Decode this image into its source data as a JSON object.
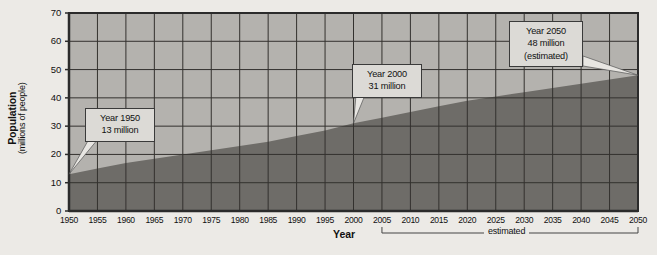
{
  "figure": {
    "background_color": "#eceae6",
    "plot_background_color": "#b4b2ae",
    "area_fill_color": "#6e6c68",
    "axis_color": "#2b2b2b",
    "grid_color": "#33312e",
    "callout_fill_color": "#dcdad6",
    "callout_border_color": "#3a3a3a"
  },
  "axes": {
    "y_title_main": "Population",
    "y_title_sub": "(millions of people)",
    "x_title": "Year",
    "y_ticks": [
      "0",
      "10",
      "20",
      "30",
      "40",
      "50",
      "60",
      "70"
    ],
    "x_ticks": [
      "1950",
      "1955",
      "1960",
      "1965",
      "1970",
      "1975",
      "1980",
      "1985",
      "1990",
      "1995",
      "2000",
      "2005",
      "2010",
      "2015",
      "2020",
      "2025",
      "2030",
      "2035",
      "2040",
      "2045",
      "2050"
    ]
  },
  "annotations": {
    "estimated_bracket_label": "estimated",
    "estimated_bracket_start_year": 2005,
    "estimated_bracket_end_year": 2050,
    "callouts": [
      {
        "name": "callout-1950",
        "lines": [
          "Year 1950",
          "13 million"
        ],
        "point_year": 1950,
        "point_value": 13
      },
      {
        "name": "callout-2000",
        "lines": [
          "Year 2000",
          "31 million"
        ],
        "point_year": 2000,
        "point_value": 31
      },
      {
        "name": "callout-2050",
        "lines": [
          "Year 2050",
          "48 million",
          "(estimated)"
        ],
        "point_year": 2050,
        "point_value": 48
      }
    ]
  },
  "chart_data": {
    "type": "area",
    "title": "",
    "subtitle": "",
    "xlabel": "Year",
    "ylabel": "Population (millions of people)",
    "xlim": [
      1950,
      2050
    ],
    "ylim": [
      0,
      70
    ],
    "grid": true,
    "legend": "none",
    "x": [
      1950,
      1955,
      1960,
      1965,
      1970,
      1975,
      1980,
      1985,
      1990,
      1995,
      2000,
      2005,
      2010,
      2015,
      2020,
      2025,
      2030,
      2035,
      2040,
      2045,
      2050
    ],
    "values": [
      13,
      15,
      17,
      18.5,
      20,
      21.5,
      23,
      24.5,
      26.5,
      28.5,
      31,
      33,
      35,
      37,
      39,
      40.5,
      42,
      43.5,
      45,
      46.5,
      48
    ],
    "series": [
      {
        "name": "Population",
        "values": [
          13,
          15,
          17,
          18.5,
          20,
          21.5,
          23,
          24.5,
          26.5,
          28.5,
          31,
          33,
          35,
          37,
          39,
          40.5,
          42,
          43.5,
          45,
          46.5,
          48
        ]
      }
    ],
    "data_labels": [
      {
        "year": 1950,
        "value": 13,
        "note": ""
      },
      {
        "year": 2000,
        "value": 31,
        "note": ""
      },
      {
        "year": 2050,
        "value": 48,
        "note": "estimated"
      }
    ]
  }
}
